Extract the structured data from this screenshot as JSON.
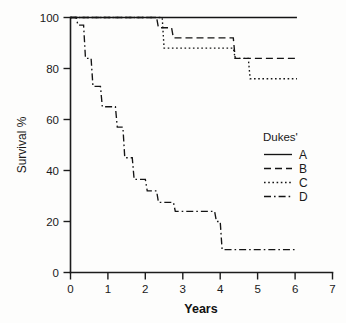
{
  "chart_data": {
    "type": "line",
    "title": "",
    "subtitle": "",
    "xlabel": "Years",
    "ylabel": "Survival %",
    "xlim": [
      0,
      7
    ],
    "ylim": [
      0,
      100
    ],
    "xticks": [
      "0",
      "1",
      "2",
      "3",
      "4",
      "5",
      "6",
      "7"
    ],
    "xtick_values": [
      0,
      1,
      2,
      3,
      4,
      5,
      6,
      7
    ],
    "yticks": [
      "0",
      "20",
      "40",
      "60",
      "80",
      "100"
    ],
    "ytick_values": [
      0,
      20,
      40,
      60,
      80,
      100
    ],
    "grid": false,
    "legend_position": "right-middle",
    "legend_title": "Dukes'",
    "curve_style": "step-post",
    "series": [
      {
        "name": "A",
        "legend_label": "A",
        "dash": "solid",
        "dash_array": "",
        "color": "#141414",
        "x": [
          0,
          6.05
        ],
        "y": [
          100,
          100
        ]
      },
      {
        "name": "B",
        "legend_label": "B",
        "dash": "dashed",
        "dash_array": "7,4",
        "color": "#141414",
        "x": [
          0,
          2.3,
          2.35,
          2.7,
          2.75,
          4.35,
          4.4,
          6.05
        ],
        "y": [
          100,
          100,
          96,
          96,
          92,
          92,
          84,
          84
        ]
      },
      {
        "name": "C",
        "legend_label": "C",
        "dash": "dotted",
        "dash_array": "1.6,2.6",
        "color": "#141414",
        "x": [
          0,
          2.45,
          2.5,
          4.35,
          4.4,
          4.75,
          4.8,
          6.05
        ],
        "y": [
          100,
          100,
          88,
          88,
          84,
          84,
          76,
          76
        ]
      },
      {
        "name": "D",
        "legend_label": "D",
        "dash": "dashdot",
        "dash_array": "7,3,1.6,3",
        "color": "#141414",
        "x": [
          0,
          0.15,
          0.2,
          0.35,
          0.4,
          0.55,
          0.6,
          0.8,
          0.85,
          1.2,
          1.25,
          1.4,
          1.45,
          1.65,
          1.7,
          2.0,
          2.05,
          2.3,
          2.35,
          2.75,
          2.8,
          3.85,
          3.9,
          4.0,
          4.05,
          6.05
        ],
        "y": [
          100,
          100,
          97,
          97,
          84,
          84,
          73,
          73,
          65,
          65,
          57,
          57,
          45,
          45,
          36.5,
          36.5,
          32,
          32,
          27.5,
          27.5,
          24,
          24,
          20,
          20,
          9,
          9
        ]
      }
    ],
    "annotations": []
  },
  "legend": {
    "title": "Dukes'",
    "entries": [
      {
        "label": "A",
        "style": "solid"
      },
      {
        "label": "B",
        "style": "dashed"
      },
      {
        "label": "C",
        "style": "dotted"
      },
      {
        "label": "D",
        "style": "dashdot"
      }
    ]
  },
  "axes": {
    "x_title": "Years",
    "y_title": "Survival %"
  }
}
